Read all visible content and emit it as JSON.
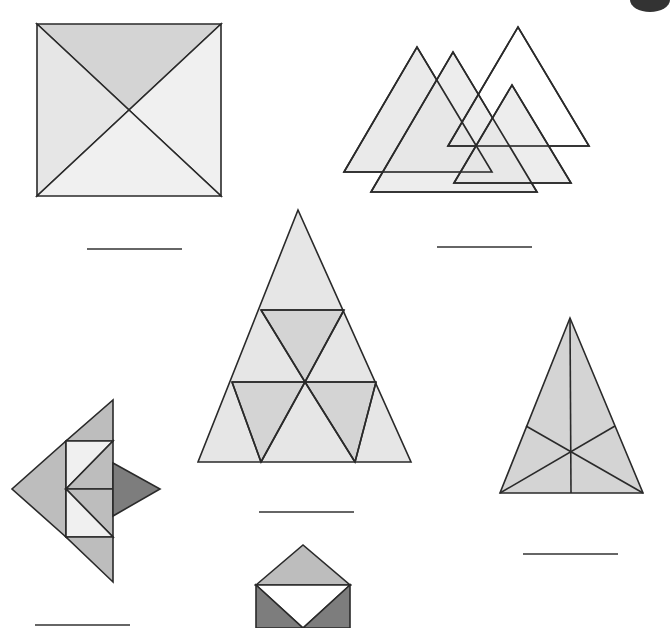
{
  "worksheet": {
    "colors": {
      "stroke": "#2a2a2a",
      "light": "#e6e6e6",
      "mid": "#d4d4d4",
      "midDark": "#bdbdbd",
      "dark": "#7d7d7d",
      "white": "#ffffff",
      "paleFill": "#f0f0f0"
    },
    "figures": [
      {
        "id": "square-with-diagonals",
        "polygons": [
          {
            "points": "37,24 221,24 129,110",
            "fill": "mid"
          },
          {
            "points": "37,24 129,110 37,196",
            "fill": "light"
          },
          {
            "points": "221,24 221,196 129,110",
            "fill": "paleFill"
          },
          {
            "points": "37,196 221,196 129,110",
            "fill": "paleFill"
          }
        ],
        "answer_line": {
          "x1": 87,
          "y1": 249,
          "x2": 182,
          "y2": 249
        }
      },
      {
        "id": "overlapping-triangles",
        "polygons": [
          {
            "points": "344,172 417,47 492,172",
            "fill": "light",
            "opacity": 0.85
          },
          {
            "points": "371,192 453,52 537,192",
            "fill": "light",
            "opacity": 0.7
          },
          {
            "points": "448,146 518,27 589,146",
            "fill": "none"
          },
          {
            "points": "454,183 512,85 571,183",
            "fill": "light",
            "opacity": 0.7
          }
        ],
        "answer_line": {
          "x1": 437,
          "y1": 247,
          "x2": 532,
          "y2": 247
        }
      },
      {
        "id": "subdivided-triangle",
        "polygons": [
          {
            "points": "298,210 198,462 411,462",
            "fill": "light"
          },
          {
            "points": "261,310 344,310 305,382",
            "fill": "mid"
          },
          {
            "points": "232,382 305,382 261,462",
            "fill": "mid"
          },
          {
            "points": "305,382 376,382 355,462",
            "fill": "mid"
          }
        ],
        "lines": [
          {
            "x1": 261,
            "y1": 310,
            "x2": 344,
            "y2": 310
          },
          {
            "x1": 232,
            "y1": 382,
            "x2": 376,
            "y2": 382
          },
          {
            "x1": 261,
            "y1": 310,
            "x2": 305,
            "y2": 382
          },
          {
            "x1": 344,
            "y1": 310,
            "x2": 305,
            "y2": 382
          },
          {
            "x1": 232,
            "y1": 382,
            "x2": 261,
            "y2": 462
          },
          {
            "x1": 305,
            "y1": 382,
            "x2": 261,
            "y2": 462
          },
          {
            "x1": 305,
            "y1": 382,
            "x2": 355,
            "y2": 462
          },
          {
            "x1": 376,
            "y1": 382,
            "x2": 355,
            "y2": 462
          }
        ],
        "answer_line": {
          "x1": 259,
          "y1": 512,
          "x2": 354,
          "y2": 512
        }
      },
      {
        "id": "fish-shape",
        "polygons": [
          {
            "points": "113,400 113,441 66,441",
            "fill": "midDark"
          },
          {
            "points": "66,441 66,537 12,489",
            "fill": "midDark"
          },
          {
            "points": "66,441 113,441 66,489",
            "fill": "paleFill"
          },
          {
            "points": "113,441 113,489 66,489",
            "fill": "midDark"
          },
          {
            "points": "66,489 113,489 113,537",
            "fill": "midDark"
          },
          {
            "points": "66,489 113,537 66,537",
            "fill": "paleFill"
          },
          {
            "points": "66,537 113,537 113,582",
            "fill": "midDark"
          },
          {
            "points": "113,463 160,489 113,516",
            "fill": "dark"
          }
        ],
        "answer_line": {
          "x1": 35,
          "y1": 625,
          "x2": 130,
          "y2": 625
        }
      },
      {
        "id": "median-triangle",
        "polygons": [
          {
            "points": "570,318 500,493 643,493",
            "fill": "mid"
          }
        ],
        "lines": [
          {
            "x1": 570,
            "y1": 318,
            "x2": 571,
            "y2": 493
          },
          {
            "x1": 500,
            "y1": 493,
            "x2": 615,
            "y2": 426
          },
          {
            "x1": 643,
            "y1": 493,
            "x2": 526,
            "y2": 426
          }
        ],
        "answer_line": {
          "x1": 523,
          "y1": 554,
          "x2": 618,
          "y2": 554
        }
      },
      {
        "id": "envelope-shape",
        "polygons": [
          {
            "points": "256,585 303,545 350,585",
            "fill": "midDark"
          },
          {
            "points": "256,585 350,585 303,628",
            "fill": "white"
          },
          {
            "points": "256,585 303,628 256,628",
            "fill": "dark"
          },
          {
            "points": "350,585 350,628 303,628",
            "fill": "dark"
          }
        ]
      }
    ],
    "corner_mark": {
      "cx": 650,
      "cy": 0,
      "rx": 20,
      "ry": 12,
      "fill": "#333333"
    }
  }
}
